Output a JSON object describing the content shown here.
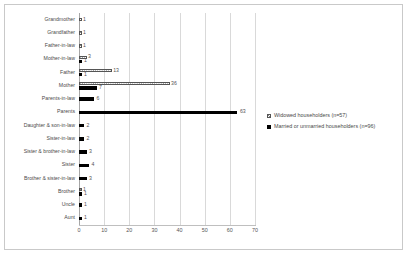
{
  "chart_data": {
    "type": "bar",
    "orientation": "horizontal",
    "title": "",
    "xlabel": "",
    "ylabel": "",
    "xlim": [
      0,
      70
    ],
    "xticks": [
      0,
      10,
      20,
      30,
      40,
      50,
      60,
      70
    ],
    "grid": true,
    "legend_position": "right",
    "categories": [
      "Grandmother",
      "Grandfather",
      "Father-in-law",
      "Mother-in-law",
      "Father",
      "Mother",
      "Parents-in-law",
      "Parents",
      "Daughter & son-in-law",
      "Sister-in-law",
      "Sister & brother-in-law",
      "Sister",
      "Brother & sister-in-law",
      "Brother",
      "Uncle",
      "Aunt"
    ],
    "series": [
      {
        "name": "Widowed householders (n=57)",
        "color": "#8c8c8c",
        "pattern": "checkered",
        "values": [
          1,
          1,
          1,
          3,
          13,
          36,
          0,
          0,
          0,
          0,
          0,
          0,
          0,
          1,
          0,
          0
        ]
      },
      {
        "name": "Married or unmarried householders (n=96)",
        "color": "#000000",
        "pattern": "solid",
        "values": [
          0,
          0,
          0,
          1,
          1,
          7,
          6,
          63,
          2,
          2,
          3,
          4,
          3,
          1,
          1,
          1
        ]
      }
    ],
    "data_labels": {
      "widowed": [
        "1",
        "1",
        "1",
        "3",
        "13",
        "36",
        "",
        "",
        "",
        "",
        "",
        "",
        "",
        "1",
        "",
        ""
      ],
      "married": [
        "",
        "",
        "",
        "1",
        "1",
        "7",
        "6",
        "63",
        "2",
        "2",
        "3",
        "4",
        "3",
        "1",
        "1",
        "1"
      ]
    }
  },
  "legend": {
    "items": [
      {
        "label": "Widowed householders (n=57)"
      },
      {
        "label": "Married or unmarried householders (n=96)"
      }
    ]
  },
  "colors": {
    "widowed": "#8c8c8c",
    "married": "#000000",
    "grid": "#d9d9d9",
    "border": "#c9c9c9"
  }
}
